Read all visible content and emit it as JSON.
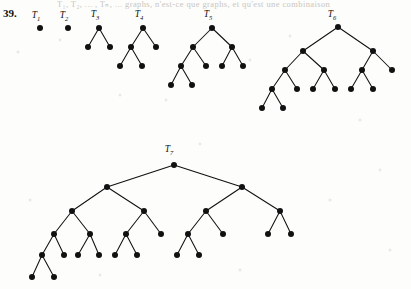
{
  "page": {
    "problem_number": "39.",
    "cut_header_text": "T₁, T₂, ... , Tₙ, ... graphs, n'est-ce que graphs, et qu'est une combinaison",
    "background_color": "#fdfdfb",
    "ink_color": "#111111",
    "width": 411,
    "height": 289
  },
  "figure": {
    "name": "fibonacci-binary-tree-sequence",
    "node_radius": 3.0,
    "trees": [
      {
        "id": "T1",
        "label": "T",
        "subscript": "1",
        "label_x": 36,
        "label_y": 18,
        "node_count": 1,
        "nodes": [
          {
            "id": "t1-n0",
            "x": 40,
            "y": 28
          }
        ],
        "edges": []
      },
      {
        "id": "T2",
        "label": "T",
        "subscript": "2",
        "label_x": 64,
        "label_y": 18,
        "node_count": 1,
        "nodes": [
          {
            "id": "t2-n0",
            "x": 68,
            "y": 28
          }
        ],
        "edges": []
      },
      {
        "id": "T3",
        "label": "T",
        "subscript": "3",
        "label_x": 95,
        "label_y": 17,
        "node_count": 3,
        "nodes": [
          {
            "id": "t3-root",
            "x": 99,
            "y": 28
          },
          {
            "id": "t3-l",
            "x": 88,
            "y": 47
          },
          {
            "id": "t3-r",
            "x": 110,
            "y": 47
          }
        ],
        "edges": [
          [
            "t3-root",
            "t3-l"
          ],
          [
            "t3-root",
            "t3-r"
          ]
        ]
      },
      {
        "id": "T4",
        "label": "T",
        "subscript": "4",
        "label_x": 139,
        "label_y": 17,
        "node_count": 5,
        "nodes": [
          {
            "id": "t4-root",
            "x": 143,
            "y": 28
          },
          {
            "id": "t4-l",
            "x": 131,
            "y": 47
          },
          {
            "id": "t4-r",
            "x": 156,
            "y": 47
          },
          {
            "id": "t4-ll",
            "x": 120,
            "y": 66
          },
          {
            "id": "t4-lr",
            "x": 142,
            "y": 66
          }
        ],
        "edges": [
          [
            "t4-root",
            "t4-l"
          ],
          [
            "t4-root",
            "t4-r"
          ],
          [
            "t4-l",
            "t4-ll"
          ],
          [
            "t4-l",
            "t4-lr"
          ]
        ]
      },
      {
        "id": "T5",
        "label": "T",
        "subscript": "5",
        "label_x": 208,
        "label_y": 17,
        "node_count": 9,
        "nodes": [
          {
            "id": "t5-root",
            "x": 212,
            "y": 28
          },
          {
            "id": "t5-l",
            "x": 193,
            "y": 47
          },
          {
            "id": "t5-r",
            "x": 232,
            "y": 47
          },
          {
            "id": "t5-ll",
            "x": 181,
            "y": 66
          },
          {
            "id": "t5-lr",
            "x": 206,
            "y": 66
          },
          {
            "id": "t5-rl",
            "x": 222,
            "y": 66
          },
          {
            "id": "t5-rr",
            "x": 243,
            "y": 66
          },
          {
            "id": "t5-lll",
            "x": 171,
            "y": 85
          },
          {
            "id": "t5-llr",
            "x": 192,
            "y": 85
          }
        ],
        "edges": [
          [
            "t5-root",
            "t5-l"
          ],
          [
            "t5-root",
            "t5-r"
          ],
          [
            "t5-l",
            "t5-ll"
          ],
          [
            "t5-l",
            "t5-lr"
          ],
          [
            "t5-r",
            "t5-rl"
          ],
          [
            "t5-r",
            "t5-rr"
          ],
          [
            "t5-ll",
            "t5-lll"
          ],
          [
            "t5-ll",
            "t5-llr"
          ]
        ]
      },
      {
        "id": "T6",
        "label": "T",
        "subscript": "6",
        "label_x": 332,
        "label_y": 17,
        "node_count": 15,
        "nodes": [
          {
            "id": "t6-root",
            "x": 338,
            "y": 27
          },
          {
            "id": "t6-l",
            "x": 303,
            "y": 51
          },
          {
            "id": "t6-r",
            "x": 373,
            "y": 51
          },
          {
            "id": "t6-ll",
            "x": 285,
            "y": 70
          },
          {
            "id": "t6-lr",
            "x": 324,
            "y": 70
          },
          {
            "id": "t6-rl",
            "x": 362,
            "y": 70
          },
          {
            "id": "t6-rr",
            "x": 392,
            "y": 70
          },
          {
            "id": "t6-lll",
            "x": 272,
            "y": 89
          },
          {
            "id": "t6-llr",
            "x": 297,
            "y": 89
          },
          {
            "id": "t6-lrl",
            "x": 313,
            "y": 89
          },
          {
            "id": "t6-lrr",
            "x": 335,
            "y": 89
          },
          {
            "id": "t6-rll",
            "x": 351,
            "y": 89
          },
          {
            "id": "t6-rlr",
            "x": 373,
            "y": 89
          },
          {
            "id": "t6-llll",
            "x": 262,
            "y": 108
          },
          {
            "id": "t6-lllr",
            "x": 283,
            "y": 108
          }
        ],
        "edges": [
          [
            "t6-root",
            "t6-l"
          ],
          [
            "t6-root",
            "t6-r"
          ],
          [
            "t6-l",
            "t6-ll"
          ],
          [
            "t6-l",
            "t6-lr"
          ],
          [
            "t6-r",
            "t6-rl"
          ],
          [
            "t6-r",
            "t6-rr"
          ],
          [
            "t6-ll",
            "t6-lll"
          ],
          [
            "t6-ll",
            "t6-llr"
          ],
          [
            "t6-lr",
            "t6-lrl"
          ],
          [
            "t6-lr",
            "t6-lrr"
          ],
          [
            "t6-rl",
            "t6-rll"
          ],
          [
            "t6-rl",
            "t6-rlr"
          ],
          [
            "t6-lll",
            "t6-llll"
          ],
          [
            "t6-lll",
            "t6-lllr"
          ]
        ]
      },
      {
        "id": "T7",
        "label": "T",
        "subscript": "7",
        "label_x": 169,
        "label_y": 152,
        "node_count": 25,
        "nodes": [
          {
            "id": "t7-root",
            "x": 174,
            "y": 165
          },
          {
            "id": "t7-l",
            "x": 107,
            "y": 187
          },
          {
            "id": "t7-r",
            "x": 242,
            "y": 187
          },
          {
            "id": "t7-ll",
            "x": 72,
            "y": 211
          },
          {
            "id": "t7-lr",
            "x": 144,
            "y": 211
          },
          {
            "id": "t7-rl",
            "x": 206,
            "y": 211
          },
          {
            "id": "t7-rr",
            "x": 280,
            "y": 211
          },
          {
            "id": "t7-lll",
            "x": 54,
            "y": 234
          },
          {
            "id": "t7-llr",
            "x": 90,
            "y": 234
          },
          {
            "id": "t7-lrl",
            "x": 126,
            "y": 234
          },
          {
            "id": "t7-lrr",
            "x": 161,
            "y": 234
          },
          {
            "id": "t7-rll",
            "x": 188,
            "y": 234
          },
          {
            "id": "t7-rlr",
            "x": 223,
            "y": 234
          },
          {
            "id": "t7-rrl",
            "x": 268,
            "y": 234
          },
          {
            "id": "t7-rrr",
            "x": 291,
            "y": 234
          },
          {
            "id": "t7-llll",
            "x": 42,
            "y": 255
          },
          {
            "id": "t7-lllr",
            "x": 64,
            "y": 255
          },
          {
            "id": "t7-llrl",
            "x": 78,
            "y": 255
          },
          {
            "id": "t7-llrr",
            "x": 99,
            "y": 255
          },
          {
            "id": "t7-lrll",
            "x": 115,
            "y": 255
          },
          {
            "id": "t7-lrlr",
            "x": 137,
            "y": 255
          },
          {
            "id": "t7-rlll",
            "x": 177,
            "y": 255
          },
          {
            "id": "t7-rllr",
            "x": 199,
            "y": 255
          },
          {
            "id": "t7-lllll",
            "x": 32,
            "y": 277
          },
          {
            "id": "t7-llllr",
            "x": 54,
            "y": 277
          }
        ],
        "edges": [
          [
            "t7-root",
            "t7-l"
          ],
          [
            "t7-root",
            "t7-r"
          ],
          [
            "t7-l",
            "t7-ll"
          ],
          [
            "t7-l",
            "t7-lr"
          ],
          [
            "t7-r",
            "t7-rl"
          ],
          [
            "t7-r",
            "t7-rr"
          ],
          [
            "t7-ll",
            "t7-lll"
          ],
          [
            "t7-ll",
            "t7-llr"
          ],
          [
            "t7-lr",
            "t7-lrl"
          ],
          [
            "t7-lr",
            "t7-lrr"
          ],
          [
            "t7-rl",
            "t7-rll"
          ],
          [
            "t7-rl",
            "t7-rlr"
          ],
          [
            "t7-rr",
            "t7-rrl"
          ],
          [
            "t7-rr",
            "t7-rrr"
          ],
          [
            "t7-lll",
            "t7-llll"
          ],
          [
            "t7-lll",
            "t7-lllr"
          ],
          [
            "t7-llr",
            "t7-llrl"
          ],
          [
            "t7-llr",
            "t7-llrr"
          ],
          [
            "t7-lrl",
            "t7-lrll"
          ],
          [
            "t7-lrl",
            "t7-lrlr"
          ],
          [
            "t7-rll",
            "t7-rlll"
          ],
          [
            "t7-rll",
            "t7-rllr"
          ],
          [
            "t7-llll",
            "t7-lllll"
          ],
          [
            "t7-llll",
            "t7-llllr"
          ]
        ]
      }
    ],
    "specks": [
      {
        "x": 18,
        "y": 52,
        "r": 1.6
      },
      {
        "x": 60,
        "y": 40,
        "r": 1.4
      },
      {
        "x": 120,
        "y": 95,
        "r": 1.5
      },
      {
        "x": 166,
        "y": 100,
        "r": 1.4
      },
      {
        "x": 250,
        "y": 60,
        "r": 1.5
      },
      {
        "x": 290,
        "y": 36,
        "r": 1.4
      },
      {
        "x": 360,
        "y": 120,
        "r": 1.6
      },
      {
        "x": 30,
        "y": 200,
        "r": 1.5
      },
      {
        "x": 200,
        "y": 144,
        "r": 1.4
      },
      {
        "x": 330,
        "y": 200,
        "r": 1.6
      },
      {
        "x": 390,
        "y": 250,
        "r": 1.5
      },
      {
        "x": 100,
        "y": 275,
        "r": 1.4
      },
      {
        "x": 240,
        "y": 270,
        "r": 1.5
      },
      {
        "x": 380,
        "y": 170,
        "r": 1.4
      }
    ]
  }
}
